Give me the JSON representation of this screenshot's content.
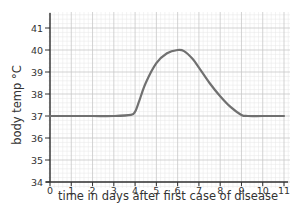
{
  "chart_data": {
    "type": "line",
    "title": "",
    "xlabel": "time in days after first case of disease",
    "ylabel": "body temp °C",
    "xlim": [
      0,
      11
    ],
    "ylim": [
      34,
      41
    ],
    "x_ticks": [
      0,
      1,
      2,
      3,
      4,
      5,
      6,
      7,
      8,
      9,
      10,
      11
    ],
    "y_ticks": [
      34,
      35,
      36,
      37,
      38,
      39,
      40,
      41
    ],
    "grid": true,
    "legend": null,
    "series": [
      {
        "name": "body temperature",
        "color": "#707070",
        "x": [
          0,
          1,
          2,
          3,
          3.8,
          4.0,
          4.2,
          4.5,
          5.0,
          5.5,
          6.0,
          6.3,
          6.7,
          7.0,
          7.5,
          8.0,
          8.5,
          9.0,
          9.3,
          10,
          11
        ],
        "y": [
          37,
          37,
          37,
          37,
          37.05,
          37.2,
          37.7,
          38.5,
          39.4,
          39.85,
          40.0,
          39.95,
          39.6,
          39.2,
          38.5,
          37.9,
          37.4,
          37.05,
          37,
          37,
          37
        ]
      }
    ]
  },
  "colors": {
    "grid_major": "#c8c8c8",
    "grid_minor": "#e6e6e6",
    "axis": "#333333",
    "curve": "#707070"
  }
}
